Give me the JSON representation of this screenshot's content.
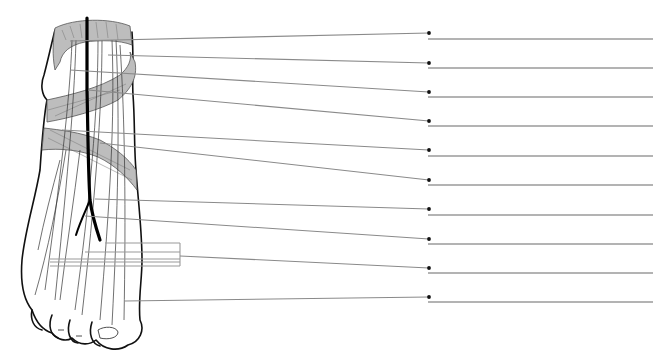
{
  "figure": {
    "colors": {
      "background": "#ffffff",
      "retinaculum_fill": "#bdbdbd",
      "outline": "#111111",
      "leader_line": "#8a8a8a",
      "answer_line": "#9a9a9a",
      "dot": "#111111"
    }
  },
  "labels": [
    {
      "index": 1,
      "text": "",
      "leader_from": [
        70,
        41
      ],
      "dot": [
        429,
        33
      ],
      "line_y": 39
    },
    {
      "index": 2,
      "text": "",
      "leader_from": [
        108,
        55
      ],
      "dot": [
        429,
        63
      ],
      "line_y": 68
    },
    {
      "index": 3,
      "text": "",
      "leader_from": [
        70,
        70
      ],
      "dot": [
        429,
        92
      ],
      "line_y": 97
    },
    {
      "index": 4,
      "text": "",
      "leader_from": [
        88,
        90
      ],
      "dot": [
        429,
        121
      ],
      "line_y": 126
    },
    {
      "index": 5,
      "text": "",
      "leader_from": [
        62,
        130
      ],
      "dot": [
        429,
        150
      ],
      "line_y": 156
    },
    {
      "index": 6,
      "text": "",
      "leader_from": [
        100,
        143
      ],
      "dot": [
        429,
        180
      ],
      "line_y": 185
    },
    {
      "index": 7,
      "text": "",
      "leader_from": [
        95,
        199
      ],
      "dot": [
        429,
        209
      ],
      "line_y": 215
    },
    {
      "index": 8,
      "text": "",
      "leader_from": [
        85,
        216
      ],
      "dot": [
        429,
        239
      ],
      "line_y": 244
    },
    {
      "index": 9,
      "text": "",
      "leader_from": [
        180,
        256
      ],
      "dot": [
        429,
        268
      ],
      "line_y": 273
    },
    {
      "index": 10,
      "text": "",
      "leader_from": [
        125,
        301
      ],
      "dot": [
        429,
        297
      ],
      "line_y": 302
    }
  ],
  "answer_lines": {
    "x_start": 428,
    "x_end": 653
  },
  "bracket_group": {
    "right_x": 180,
    "lines": [
      {
        "x_from": 105,
        "y": 243
      },
      {
        "x_from": 85,
        "y": 252
      },
      {
        "x_from": 50,
        "y": 259
      },
      {
        "x_from": 50,
        "y": 262
      },
      {
        "x_from": 50,
        "y": 266
      }
    ]
  }
}
